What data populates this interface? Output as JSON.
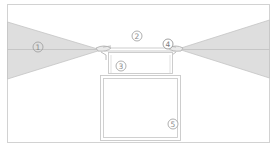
{
  "diagram": {
    "colors": {
      "background": "#ffffff",
      "line": "#c8c8c8",
      "cone_fill": "#dcdcdc",
      "label_stroke": "#9a9a9a",
      "label_text": "#8a8a8a"
    },
    "callouts": [
      {
        "id": "1",
        "label": "1",
        "x": 38,
        "y": 47
      },
      {
        "id": "2",
        "label": "2",
        "x": 137,
        "y": 36
      },
      {
        "id": "3",
        "label": "3",
        "x": 121,
        "y": 66
      },
      {
        "id": "4",
        "label": "4",
        "x": 168,
        "y": 44
      },
      {
        "id": "5",
        "label": "5",
        "x": 173,
        "y": 124
      }
    ]
  }
}
